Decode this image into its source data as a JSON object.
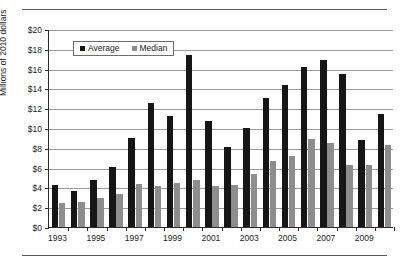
{
  "chart_data": {
    "type": "bar",
    "title": "",
    "subtitle": "",
    "xlabel": "",
    "ylabel": "Millions of 2010 dollars",
    "ylim": [
      0,
      20
    ],
    "ytick_labels": [
      "$20",
      "$18",
      "$16",
      "$14",
      "$12",
      "$10",
      "$8",
      "$6",
      "$4",
      "$2",
      "$0"
    ],
    "ytick_values": [
      20,
      18,
      16,
      14,
      12,
      10,
      8,
      6,
      4,
      2,
      0
    ],
    "grid": true,
    "legend_position": "top-left-inside",
    "categories": [
      1993,
      1994,
      1995,
      1996,
      1997,
      1998,
      1999,
      2000,
      2001,
      2002,
      2003,
      2004,
      2005,
      2006,
      2007,
      2008,
      2009,
      2010
    ],
    "xtick_labels": [
      "1993",
      "1995",
      "1997",
      "1999",
      "2001",
      "2003",
      "2005",
      "2007",
      "2009"
    ],
    "xtick_categories": [
      1993,
      1995,
      1997,
      1999,
      2001,
      2003,
      2005,
      2007,
      2009
    ],
    "series": [
      {
        "name": "Average",
        "color": "#161616",
        "values": [
          4.2,
          3.6,
          4.7,
          6.1,
          9.0,
          12.5,
          11.2,
          17.4,
          10.7,
          8.1,
          10.0,
          13.0,
          14.3,
          16.2,
          16.9,
          15.5,
          8.8,
          11.4
        ]
      },
      {
        "name": "Median",
        "color": "#8d8d8d",
        "values": [
          2.4,
          2.5,
          2.9,
          3.3,
          4.3,
          4.1,
          4.4,
          4.7,
          4.1,
          4.2,
          5.4,
          6.7,
          7.2,
          8.9,
          8.5,
          6.3,
          6.3,
          8.3
        ]
      }
    ]
  },
  "legend": {
    "items": [
      {
        "label": "Average"
      },
      {
        "label": "Median"
      }
    ]
  }
}
